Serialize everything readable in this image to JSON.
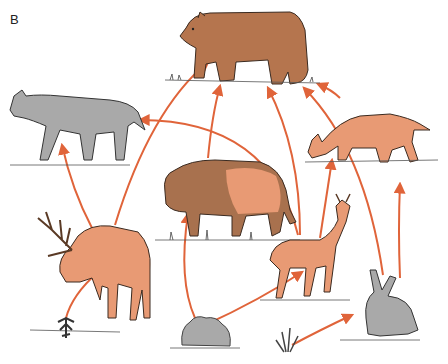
{
  "figure": {
    "panel_label": "B",
    "type": "food web"
  },
  "colors": {
    "arrow": "#e0643a",
    "herbivore_fill": "#e89a74",
    "bear_fill": "#b5754e",
    "bison_front": "#a8714e",
    "gray_fill": "#a9a9a9",
    "plant_fill": "#8a8a8a",
    "ink": "#3a2a20"
  },
  "organisms": [
    {
      "id": "bear",
      "label": "bear",
      "color": "brown"
    },
    {
      "id": "wolf",
      "label": "wolf",
      "color": "gray"
    },
    {
      "id": "coyote",
      "label": "coyote",
      "color": "orange"
    },
    {
      "id": "bison",
      "label": "bison",
      "color": "brown-orange"
    },
    {
      "id": "elk",
      "label": "elk",
      "color": "orange"
    },
    {
      "id": "deer",
      "label": "deer",
      "color": "orange"
    },
    {
      "id": "rabbit",
      "label": "rabbit",
      "color": "gray"
    },
    {
      "id": "shrub",
      "label": "small shrub",
      "color": "dark gray"
    },
    {
      "id": "bush",
      "label": "bush",
      "color": "gray"
    },
    {
      "id": "grass",
      "label": "grass",
      "color": "gray"
    }
  ],
  "arrows": [
    {
      "from": "shrub",
      "to": "elk"
    },
    {
      "from": "bush",
      "to": "bison"
    },
    {
      "from": "bush",
      "to": "deer"
    },
    {
      "from": "grass",
      "to": "rabbit"
    },
    {
      "from": "elk",
      "to": "wolf"
    },
    {
      "from": "elk",
      "to": "bear"
    },
    {
      "from": "bison",
      "to": "bear"
    },
    {
      "from": "deer",
      "to": "wolf"
    },
    {
      "from": "deer",
      "to": "bear"
    },
    {
      "from": "deer",
      "to": "coyote"
    },
    {
      "from": "rabbit",
      "to": "bear"
    },
    {
      "from": "rabbit",
      "to": "coyote"
    },
    {
      "from": "coyote",
      "to": "bear"
    }
  ]
}
